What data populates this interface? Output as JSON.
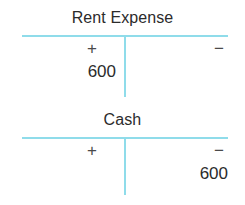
{
  "diagram": {
    "type": "t-accounts",
    "colors": {
      "rule": "#8fdcea",
      "text": "#2b2b2b",
      "background": "#ffffff"
    },
    "accounts": [
      {
        "title": "Rent Expense",
        "debit_sign": "+",
        "credit_sign": "−",
        "debit_amount": "600",
        "credit_amount": ""
      },
      {
        "title": "Cash",
        "debit_sign": "+",
        "credit_sign": "−",
        "debit_amount": "",
        "credit_amount": "600"
      }
    ]
  }
}
